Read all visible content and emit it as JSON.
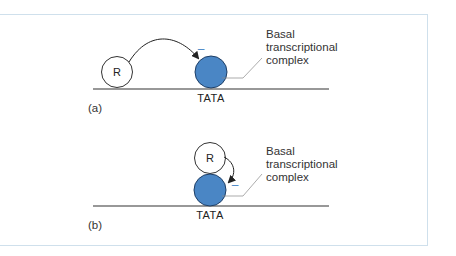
{
  "colors": {
    "frame_border": "#cfe0ec",
    "complex_fill": "#4a86c5",
    "complex_stroke": "#1f3f66",
    "minus_sign": "#4a86c5",
    "line": "#333333"
  },
  "panels": [
    {
      "id": "a",
      "panel_label": "(a)",
      "repressor_label": "R",
      "promoter_label": "TATA",
      "callout_lines": [
        "Basal",
        "transcriptional",
        "complex"
      ],
      "minus_symbol": "–"
    },
    {
      "id": "b",
      "panel_label": "(b)",
      "repressor_label": "R",
      "promoter_label": "TATA",
      "callout_lines": [
        "Basal",
        "transcriptional",
        "complex"
      ],
      "minus_symbol": "–"
    }
  ]
}
